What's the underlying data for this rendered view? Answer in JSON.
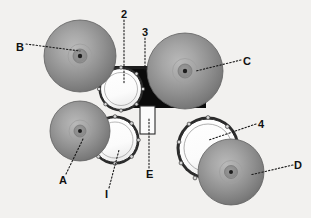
{
  "figure": {
    "background_color": "#f2f1ef",
    "line_color": "#1a1a1a",
    "leader_style": "dotted"
  },
  "labels": [
    {
      "id": "label-b",
      "text": "B",
      "x": 16,
      "y": 47,
      "target_x": 78,
      "target_y": 52
    },
    {
      "id": "label-2",
      "text": "2",
      "x": 122,
      "y": 14,
      "target_x": 123,
      "target_y": 80
    },
    {
      "id": "label-3",
      "text": "3",
      "x": 143,
      "y": 32,
      "target_x": 144,
      "target_y": 72
    },
    {
      "id": "label-c",
      "text": "C",
      "x": 243,
      "y": 62,
      "target_x": 193,
      "target_y": 72
    },
    {
      "id": "label-4",
      "text": "4",
      "x": 258,
      "y": 125,
      "target_x": 207,
      "target_y": 139
    },
    {
      "id": "label-d",
      "text": "D",
      "x": 295,
      "y": 166,
      "target_x": 248,
      "target_y": 178
    },
    {
      "id": "label-a",
      "text": "A",
      "x": 60,
      "y": 179,
      "target_x": 82,
      "target_y": 140
    },
    {
      "id": "label-1",
      "text": "I",
      "x": 105,
      "y": 193,
      "target_x": 117,
      "target_y": 152
    },
    {
      "id": "label-e",
      "text": "E",
      "x": 147,
      "y": 173,
      "target_x": 148,
      "target_y": 118
    }
  ],
  "cymbals": [
    {
      "id": "cymbal-b",
      "label": "B",
      "cx": 80,
      "cy": 56,
      "r": 36,
      "center_dot_r": 2.2,
      "bell_r": 7
    },
    {
      "id": "cymbal-c",
      "label": "C",
      "cx": 185,
      "cy": 71,
      "r": 38,
      "center_dot_r": 2.2,
      "bell_r": 7
    },
    {
      "id": "cymbal-a",
      "label": "A",
      "cx": 80,
      "cy": 131,
      "r": 30,
      "center_dot_r": 2.0,
      "bell_r": 6
    },
    {
      "id": "cymbal-d",
      "label": "D",
      "cx": 231,
      "cy": 172,
      "r": 33,
      "center_dot_r": 2.0,
      "bell_r": 6
    }
  ],
  "drums": [
    {
      "id": "drum-tom-upper",
      "label": "2",
      "cx": 121,
      "cy": 89,
      "r": 22,
      "lugs": 8
    },
    {
      "id": "drum-tom-lower",
      "label": "1",
      "cx": 115,
      "cy": 140,
      "r": 24,
      "lugs": 8
    },
    {
      "id": "drum-floor-right",
      "label": "4",
      "cx": 208,
      "cy": 148,
      "r": 31,
      "lugs": 9
    }
  ],
  "hardware": {
    "base_plate": {
      "id": "base-plate",
      "description": "black mounting base",
      "color": "#0b0b0b"
    },
    "rail": {
      "id": "mount-rail",
      "description": "horizontal mounting rail",
      "y": 68,
      "x1": 101,
      "x2": 196
    },
    "post": {
      "id": "pedestal-post",
      "description": "vertical pedestal post",
      "x": 140,
      "y1": 105,
      "y2": 133,
      "width": 16
    }
  }
}
